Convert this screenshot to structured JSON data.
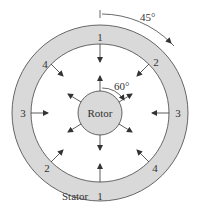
{
  "diagram": {
    "labels": {
      "rotor": "Rotor",
      "stator": "Stator",
      "angle_outer": "45°",
      "angle_inner": "60°"
    },
    "stator_poles": [
      {
        "id": "pole-1-top",
        "label": "1"
      },
      {
        "id": "pole-2-top-right",
        "label": "2"
      },
      {
        "id": "pole-3-right",
        "label": "3"
      },
      {
        "id": "pole-4-bottom-right",
        "label": "4"
      },
      {
        "id": "pole-1-bottom",
        "label": "1"
      },
      {
        "id": "pole-2-bottom-left",
        "label": "2"
      },
      {
        "id": "pole-3-left",
        "label": "3"
      },
      {
        "id": "pole-4-top-left",
        "label": "4"
      }
    ],
    "colors": {
      "stator_fill": "#d9d9d9",
      "rotor_fill": "#d9d9d9",
      "stroke": "#444444"
    }
  }
}
